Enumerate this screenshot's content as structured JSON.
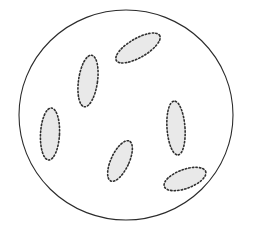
{
  "figure": {
    "title": "Circular field containing six dotted-outline ellipses",
    "canvas": {
      "width": 254,
      "height": 234,
      "background_color": "#ffffff"
    },
    "boundary": {
      "name": "outer-circle",
      "shape": "circle",
      "center_x": 126,
      "center_y": 115,
      "radius_x": 107,
      "radius_y": 105,
      "stroke_color": "#2b2b2b",
      "stroke_width": 1.1,
      "fill_color": "#ffffff",
      "line_style": "solid"
    },
    "ellipse_style": {
      "fill_color": "#e9e9e9",
      "stroke_color": "#2f2f2f",
      "stroke_width": 1.6,
      "line_style": "dotted",
      "dash_pattern": "1.4 2.1"
    },
    "ellipse_count": 6,
    "ellipses": [
      {
        "id": "ellipse-top-right",
        "label": "top-right ellipse",
        "center_x": 138,
        "center_y": 48,
        "radius_x": 25,
        "radius_y": 9.5,
        "rotation_deg": -30
      },
      {
        "id": "ellipse-upper-left",
        "label": "upper-left ellipse",
        "center_x": 88,
        "center_y": 81,
        "radius_x": 9.5,
        "radius_y": 26,
        "rotation_deg": 8
      },
      {
        "id": "ellipse-left",
        "label": "left ellipse",
        "center_x": 50,
        "center_y": 134,
        "radius_x": 9.5,
        "radius_y": 26,
        "rotation_deg": 3
      },
      {
        "id": "ellipse-right",
        "label": "right ellipse",
        "center_x": 176,
        "center_y": 128,
        "radius_x": 9,
        "radius_y": 27,
        "rotation_deg": -4
      },
      {
        "id": "ellipse-bottom-center",
        "label": "bottom-center ellipse",
        "center_x": 120,
        "center_y": 161,
        "radius_x": 9,
        "radius_y": 22,
        "rotation_deg": 25
      },
      {
        "id": "ellipse-bottom-right",
        "label": "bottom-right ellipse",
        "center_x": 185,
        "center_y": 179,
        "radius_x": 22,
        "radius_y": 9.5,
        "rotation_deg": -20
      }
    ]
  }
}
